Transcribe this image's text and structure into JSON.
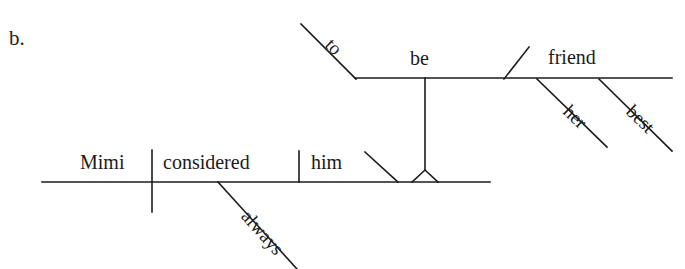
{
  "figure": {
    "exercise_label": "b.",
    "kind": "reed-kellogg-sentence-diagram",
    "ink_color": "#1b1b1b",
    "background_color": "#ffffff"
  },
  "words": {
    "subject": "Mimi",
    "verb": "considered",
    "direct_object": "him",
    "object_complement_verb": "be",
    "infinitive_marker": "to",
    "complement_noun": "friend",
    "possessive_modifier": "her",
    "adjective_modifier": "best",
    "adverb_modifier": "always"
  },
  "diagram_lines": {
    "main_baseline": {
      "x1": 42,
      "y1": 182,
      "x2": 490,
      "y2": 182
    },
    "subject_verb_divider": {
      "x1": 152,
      "y1": 150,
      "x2": 152,
      "y2": 212
    },
    "verb_object_divider": {
      "x1": 299,
      "y1": 151,
      "x2": 299,
      "y2": 182
    },
    "object_complement_slant": {
      "x1": 365,
      "y1": 152,
      "x2": 397,
      "y2": 182
    },
    "always_slant": {
      "x1": 218,
      "y1": 182,
      "x2": 297,
      "y2": 269
    },
    "pedestal_triangle": {
      "apex_x": 425,
      "apex_y": 170,
      "base_left_x": 412,
      "base_right_x": 438,
      "base_y": 182
    },
    "pedestal_stem": {
      "x1": 425,
      "y1": 78,
      "x2": 425,
      "y2": 170
    },
    "upper_baseline": {
      "x1": 355,
      "y1": 78,
      "x2": 672,
      "y2": 78
    },
    "infinitive_to_slant": {
      "x1": 301,
      "y1": 24,
      "x2": 356,
      "y2": 78
    },
    "upper_verb_complement_slant": {
      "x1": 529,
      "y1": 47,
      "x2": 505,
      "y2": 79
    },
    "her_slant": {
      "x1": 537,
      "y1": 79,
      "x2": 607,
      "y2": 147
    },
    "best_slant": {
      "x1": 599,
      "y1": 79,
      "x2": 672,
      "y2": 151
    }
  }
}
